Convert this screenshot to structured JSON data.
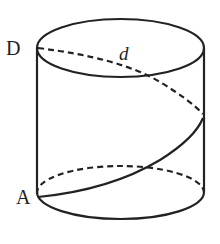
{
  "diagram": {
    "type": "cylinder-helix",
    "labels": {
      "top_left_point": "D",
      "bottom_left_point": "A",
      "diameter": "d"
    },
    "colors": {
      "stroke": "#222222",
      "background": "#ffffff"
    }
  }
}
